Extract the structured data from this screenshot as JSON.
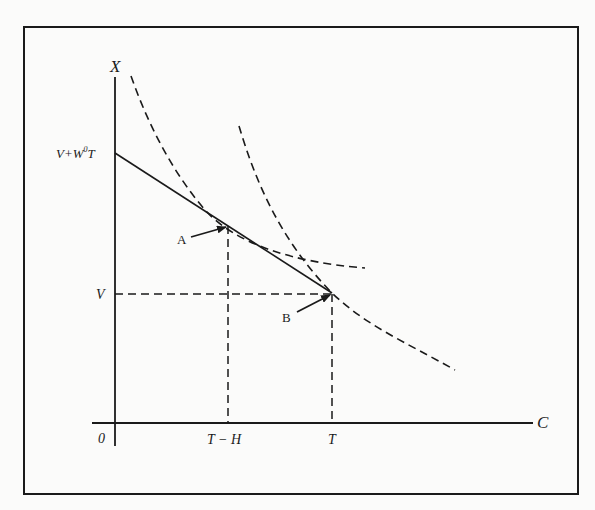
{
  "figure": {
    "type": "economic-diagram"
  },
  "axes": {
    "y_label": "X",
    "x_label": "C",
    "origin_label": "0"
  },
  "y_ticks": [
    {
      "label": "V+W⁰T",
      "base": "V+W",
      "sup": "0",
      "tail": "T"
    },
    {
      "label": "V"
    }
  ],
  "x_ticks": [
    {
      "label": "T − H"
    },
    {
      "label": "T"
    }
  ],
  "points": [
    {
      "label": "A",
      "meaning": "tangency of budget line with first indifference curve"
    },
    {
      "label": "B",
      "meaning": "corner point at (T, V) on second indifference curve"
    }
  ],
  "curves": [
    {
      "name": "budget-line",
      "style": "solid",
      "from": "V+W0T",
      "to": "B"
    },
    {
      "name": "indifference-curve-1",
      "style": "dashed",
      "tangent_at": "A"
    },
    {
      "name": "indifference-curve-2",
      "style": "dashed",
      "passes_through": "B"
    }
  ],
  "guides": [
    {
      "name": "v-level-line",
      "style": "dashed",
      "from": "V",
      "to": "B"
    },
    {
      "name": "t-minus-h-drop-line",
      "style": "dashed",
      "from": "A",
      "to": "T − H"
    },
    {
      "name": "t-drop-line",
      "style": "dashed",
      "from": "B",
      "to": "T"
    }
  ],
  "colors": {
    "ink": "#1a1a1a",
    "paper": "#fbfbfa"
  }
}
